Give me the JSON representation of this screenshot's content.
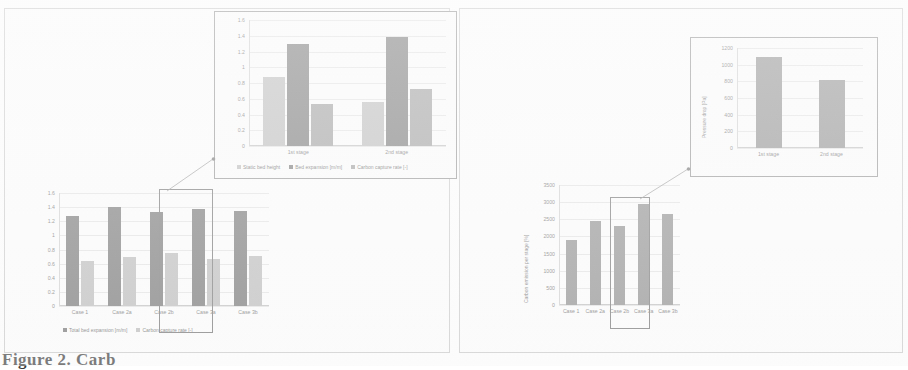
{
  "figure": {
    "caption": "Figure 2. Carb",
    "panels": [
      "left",
      "right"
    ]
  },
  "left_panel": {
    "main_chart_name": "bed-expansion-capture-chart",
    "inset_chart_name": "stagewise-bed-chart",
    "highlighted_case": "Case 2b"
  },
  "right_panel": {
    "main_chart_name": "carbon-emission-chart",
    "inset_chart_name": "stagewise-pressure-chart",
    "highlighted_case": "Case 2b"
  },
  "chart_data": [
    {
      "id": "left-main",
      "type": "bar",
      "title": "",
      "xlabel": "",
      "ylabel": "",
      "categories": [
        "Case 1",
        "Case 2a",
        "Case 2b",
        "Case 3a",
        "Case 3b"
      ],
      "yticks": [
        "1.6",
        "1.4",
        "1.2",
        "1",
        "0.8",
        "0.6",
        "0.4",
        "0.2",
        "0"
      ],
      "ylim": [
        0,
        1.6
      ],
      "grid": true,
      "legend_position": "bottom",
      "series": [
        {
          "name": "Total bed expansion [m/m]",
          "color": "#6f6f6f",
          "values": [
            1.28,
            1.4,
            1.33,
            1.38,
            1.35
          ]
        },
        {
          "name": "Carbon capture rate [-]",
          "color": "#b9b9b9",
          "values": [
            0.64,
            0.69,
            0.75,
            0.67,
            0.71
          ]
        }
      ]
    },
    {
      "id": "left-inset",
      "type": "bar",
      "title": "",
      "xlabel": "",
      "ylabel": "",
      "categories": [
        "1st stage",
        "2nd stage"
      ],
      "yticks": [
        "1.6",
        "1.4",
        "1.2",
        "1",
        "0.8",
        "0.6",
        "0.4",
        "0.2",
        "0"
      ],
      "ylim": [
        0,
        1.6
      ],
      "grid": true,
      "legend_position": "bottom",
      "series": [
        {
          "name": "Static bed height",
          "color": "#b9b9b9",
          "values": [
            0.88,
            0.56
          ]
        },
        {
          "name": "Bed expansion [m/m]",
          "color": "#6f6f6f",
          "values": [
            1.3,
            1.38
          ]
        },
        {
          "name": "Carbon capture rate [-]",
          "color": "#9a9a9a",
          "values": [
            0.53,
            0.73
          ]
        }
      ]
    },
    {
      "id": "right-main",
      "type": "bar",
      "title": "",
      "xlabel": "",
      "ylabel": "Carbon emission per stage [%]",
      "categories": [
        "Case 1",
        "Case 2a",
        "Case 2b",
        "Case 3a",
        "Case 3b"
      ],
      "yticks": [
        "3500",
        "3000",
        "2500",
        "2000",
        "1500",
        "1000",
        "500",
        "0"
      ],
      "ylim": [
        0,
        3500
      ],
      "grid": true,
      "legend_position": "none",
      "series": [
        {
          "name": "Carbon emission",
          "color": "#8a8a8a",
          "values": [
            1900,
            2450,
            2300,
            2950,
            2650
          ]
        }
      ]
    },
    {
      "id": "right-inset",
      "type": "bar",
      "title": "",
      "xlabel": "",
      "ylabel": "Pressure drop [Pa]",
      "categories": [
        "1st stage",
        "2nd stage"
      ],
      "yticks": [
        "1200",
        "1000",
        "800",
        "600",
        "400",
        "200",
        "0"
      ],
      "ylim": [
        0,
        1200
      ],
      "grid": true,
      "legend_position": "none",
      "series": [
        {
          "name": "Pressure drop",
          "color": "#8a8a8a",
          "values": [
            1090,
            820
          ]
        }
      ]
    }
  ]
}
